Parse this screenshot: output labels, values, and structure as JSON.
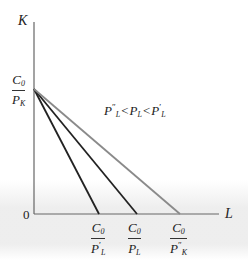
{
  "diagram": {
    "type": "isocost-lines",
    "axes": {
      "y_label": "K",
      "x_label": "L",
      "origin_label": "0"
    },
    "y_intercept": {
      "numerator": "C",
      "numerator_sub": "0",
      "denominator": "P",
      "denominator_sub": "K"
    },
    "x_intercepts": [
      {
        "numerator": "C",
        "numerator_sub": "0",
        "denominator": "P",
        "denominator_prime": "′",
        "denominator_sub": "L",
        "line_color": "#222222"
      },
      {
        "numerator": "C",
        "numerator_sub": "0",
        "denominator": "P",
        "denominator_prime": "",
        "denominator_sub": "L",
        "line_color": "#222222"
      },
      {
        "numerator": "C",
        "numerator_sub": "0",
        "denominator": "P",
        "denominator_prime": "″",
        "denominator_sub": "K",
        "line_color": "#8a8a8a"
      }
    ],
    "annotation": {
      "parts": [
        {
          "base": "P",
          "prime": "″",
          "sub": "L"
        },
        {
          "op": "<"
        },
        {
          "base": "P",
          "prime": "",
          "sub": "L"
        },
        {
          "op": "<"
        },
        {
          "base": "P",
          "prime": "′",
          "sub": "L"
        }
      ]
    },
    "colors": {
      "axis": "#555555",
      "dark_line": "#222222",
      "light_line": "#8a8a8a"
    }
  }
}
